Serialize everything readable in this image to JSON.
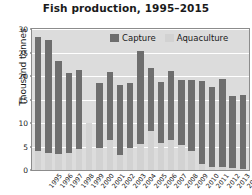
{
  "chart_data": {
    "type": "bar",
    "barmode": "stacked",
    "title": "Fish production, 1995–2015",
    "xlabel": "",
    "ylabel": "Thousand tonnes",
    "ylim": [
      0,
      30
    ],
    "yticks": [
      0,
      5,
      10,
      15,
      20,
      25,
      30
    ],
    "grid": true,
    "legend_position": "top-right-inside",
    "categories": [
      "1995",
      "1996",
      "1997",
      "1998",
      "1999",
      "2000",
      "2001",
      "2002",
      "2003",
      "2004",
      "2005",
      "2006",
      "2007",
      "2008",
      "2009",
      "2010",
      "2011",
      "2012",
      "2013",
      "2014",
      "2015"
    ],
    "series": [
      {
        "name": "Aquaculture",
        "color": "#d2d2d2",
        "values": [
          4.0,
          3.7,
          3.4,
          3.6,
          4.5,
          10.0,
          4.6,
          6.4,
          3.2,
          4.6,
          5.5,
          8.2,
          5.8,
          6.3,
          5.3,
          4.1,
          1.2,
          0.7,
          0.6,
          0.4,
          0.3
        ]
      },
      {
        "name": "Capture",
        "color": "#6e6e6e",
        "values": [
          28.2,
          27.7,
          23.3,
          20.6,
          21.2,
          10.0,
          18.6,
          20.8,
          18.0,
          18.5,
          25.4,
          21.8,
          18.8,
          21.0,
          19.2,
          19.1,
          18.9,
          17.6,
          19.4,
          15.8,
          16.0
        ]
      }
    ],
    "totals": [
      28.2,
      27.7,
      23.3,
      20.6,
      21.2,
      10.0,
      18.6,
      20.8,
      18.0,
      18.5,
      25.4,
      21.8,
      18.8,
      21.0,
      19.2,
      19.1,
      18.9,
      17.6,
      19.4,
      15.8,
      16.0
    ]
  },
  "legend": {
    "entries": [
      {
        "label": "Capture",
        "color": "#6e6e6e"
      },
      {
        "label": "Aquaculture",
        "color": "#d2d2d2"
      }
    ]
  }
}
